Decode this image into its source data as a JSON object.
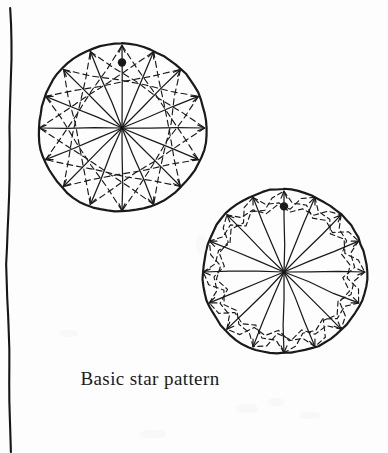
{
  "page": {
    "width": 388,
    "height": 453,
    "background_color": "#fdfdfd",
    "ink_color": "#1a1a1a"
  },
  "caption": {
    "text": "Basic star pattern",
    "x": 150,
    "y": 383
  },
  "margin_rule": {
    "name": "left-margin-line",
    "description": "hand drawn wavy vertical rule near left edge",
    "x": 9,
    "y_top": 8,
    "y_bottom": 452,
    "stroke_width": 2.1,
    "color": "#161616"
  },
  "figures": [
    {
      "id": "top-circle",
      "label": "upper star pattern circle",
      "cx": 122,
      "cy": 128,
      "r": 84,
      "spokes": 16,
      "spoke_style": "solid-with-arrowhead",
      "star_skip": 5,
      "star_style": "dashed",
      "dot_marker": {
        "angle_deg": -90,
        "radius_fraction": 0.78,
        "size": 4.2
      },
      "rim_stroke": 2.2,
      "spoke_stroke": 1.25,
      "dash_stroke": 1.15,
      "dash_pattern": "6 4",
      "wobble": 1.0
    },
    {
      "id": "bottom-circle",
      "label": "lower star pattern circle",
      "cx": 284,
      "cy": 272,
      "r": 82,
      "spokes": 16,
      "spoke_style": "solid-with-arrowhead",
      "star_skip": 3,
      "star_style": "dashed-zigzag",
      "dot_marker": {
        "angle_deg": -90,
        "radius_fraction": 0.8,
        "size": 4.2
      },
      "rim_stroke": 2.2,
      "spoke_stroke": 1.25,
      "dash_stroke": 1.15,
      "dash_pattern": "5 3.5",
      "wobble": 1.4
    }
  ],
  "grain_spots": [
    {
      "x": 236,
      "y": 404,
      "w": 22,
      "h": 9
    },
    {
      "x": 268,
      "y": 398,
      "w": 16,
      "h": 8
    },
    {
      "x": 300,
      "y": 412,
      "w": 20,
      "h": 7
    },
    {
      "x": 140,
      "y": 430,
      "w": 26,
      "h": 8
    },
    {
      "x": 196,
      "y": 236,
      "w": 10,
      "h": 18
    },
    {
      "x": 60,
      "y": 330,
      "w": 18,
      "h": 7
    }
  ]
}
